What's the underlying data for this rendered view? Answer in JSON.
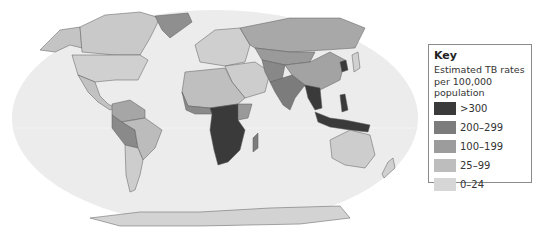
{
  "key": {
    "title": "Key",
    "subtitle": "Estimated TB rates per 100,000 population",
    "items": [
      {
        "label": ">300",
        "color": "#3a3a3a"
      },
      {
        "label": "200–299",
        "color": "#7c7c7c"
      },
      {
        "label": "100–199",
        "color": "#9c9c9c"
      },
      {
        "label": "25–99",
        "color": "#bdbdbd"
      },
      {
        "label": "0–24",
        "color": "#d6d6d6"
      }
    ]
  },
  "map": {
    "ocean_color": "#ececec",
    "border_color": "#5a5a5a",
    "projection": "Robinson-style world map"
  }
}
